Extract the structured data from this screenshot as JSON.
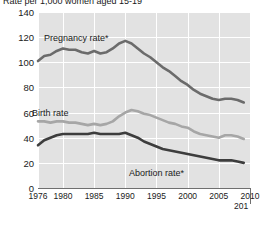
{
  "title": "Rate per 1,000 women aged 15-19",
  "axes": {
    "y_ticks": [
      "140",
      "120",
      "100",
      "80",
      "60",
      "40",
      "20",
      "0"
    ],
    "x_ticks": [
      "1976",
      "1980",
      "1985",
      "1990",
      "1995",
      "2000",
      "2005",
      "2010"
    ],
    "x_extra_clipped": "201"
  },
  "labels": {
    "pregnancy": "Pregnancy rate*",
    "birth": "Birth rate",
    "abortion": "Abortion rate*"
  },
  "colors": {
    "plot_background": "#e2e2e2",
    "gridline": "#ffffff",
    "pregnancy_line": "#6b6b6b",
    "birth_line": "#a6a6a6",
    "abortion_line": "#3d3d3d",
    "axis": "#6f6f6f",
    "text": "#1a1a1a"
  },
  "chart_data": {
    "type": "line",
    "title": "Rate per 1,000 women aged 15-19",
    "xlabel": "",
    "ylabel": "Rate per 1,000 women aged 15-19",
    "xlim": [
      1976,
      2010
    ],
    "ylim": [
      0,
      140
    ],
    "grid": true,
    "legend": "inline-annotations",
    "x": [
      1976,
      1977,
      1978,
      1979,
      1980,
      1981,
      1982,
      1983,
      1984,
      1985,
      1986,
      1987,
      1988,
      1989,
      1990,
      1991,
      1992,
      1993,
      1994,
      1995,
      1996,
      1997,
      1998,
      1999,
      2000,
      2001,
      2002,
      2003,
      2004,
      2005,
      2006,
      2007,
      2008,
      2009
    ],
    "series": [
      {
        "name": "Pregnancy rate*",
        "color": "#6b6b6b",
        "values": [
          101,
          105,
          106,
          109,
          111,
          110,
          110,
          108,
          107,
          109,
          107,
          108,
          111,
          115,
          117,
          115,
          111,
          107,
          104,
          100,
          96,
          93,
          89,
          85,
          82,
          78,
          75,
          73,
          71,
          70,
          71,
          71,
          70,
          68
        ]
      },
      {
        "name": "Birth rate",
        "color": "#a6a6a6",
        "values": [
          53,
          53,
          52,
          53,
          53,
          52,
          52,
          51,
          50,
          51,
          50,
          51,
          53,
          57,
          60,
          62,
          61,
          59,
          58,
          56,
          54,
          52,
          51,
          49,
          48,
          45,
          43,
          42,
          41,
          40,
          42,
          42,
          41,
          39
        ]
      },
      {
        "name": "Abortion rate*",
        "color": "#3d3d3d",
        "values": [
          34,
          38,
          40,
          42,
          43,
          43,
          43,
          43,
          43,
          44,
          43,
          43,
          43,
          43,
          44,
          42,
          40,
          37,
          35,
          33,
          31,
          30,
          29,
          28,
          27,
          26,
          25,
          24,
          23,
          22,
          22,
          22,
          21,
          20
        ]
      }
    ]
  }
}
